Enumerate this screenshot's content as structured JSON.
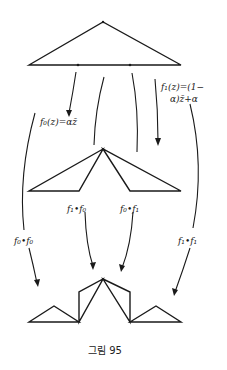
{
  "figure": {
    "caption": "그림 95",
    "labels": {
      "f0_def": "f₀(z)=αz̄",
      "f1_def_line1": "f₁(z)=(1−",
      "f1_def_line2": "α)z̄+α",
      "f0f0": "f₀•f₀",
      "f1f0": "f₁•f₀",
      "f0f1": "f₀•f₁",
      "f1f1": "f₁•f₁"
    },
    "levels": [
      {
        "name": "level-0",
        "description": "initial triangle with base divided at two points"
      },
      {
        "name": "level-1",
        "description": "images under f0 and f1 sharing apex"
      },
      {
        "name": "level-2",
        "description": "images under f0∘f0, f1∘f0, f0∘f1, f1∘f1"
      }
    ],
    "colors": {
      "stroke": "#1a1a1a",
      "background": "#ffffff"
    }
  }
}
